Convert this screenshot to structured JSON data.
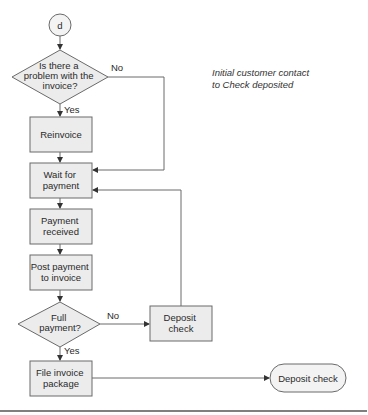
{
  "annotation": {
    "line1": "Initial customer contact",
    "line2": "to Check deposited"
  },
  "connector": {
    "label": "d"
  },
  "nodes": {
    "problem_decision": {
      "lines": [
        "Is there a",
        "problem with the",
        "invoice?"
      ],
      "yes": "Yes",
      "no": "No"
    },
    "reinvoice": {
      "lines": [
        "Reinvoice"
      ]
    },
    "wait_payment": {
      "lines": [
        "Wait for",
        "payment"
      ]
    },
    "payment_received": {
      "lines": [
        "Payment",
        "received"
      ]
    },
    "post_payment": {
      "lines": [
        "Post payment",
        "to invoice"
      ]
    },
    "full_payment_decision": {
      "lines": [
        "Full",
        "payment?"
      ],
      "yes": "Yes",
      "no": "No"
    },
    "deposit_check_box": {
      "lines": [
        "Deposit",
        "check"
      ]
    },
    "file_invoice": {
      "lines": [
        "File invoice",
        "package"
      ]
    },
    "deposit_check_terminal": {
      "lines": [
        "Deposit check"
      ]
    }
  },
  "colors": {
    "shape_fill": "#ececec",
    "stroke": "#6a6a6a",
    "text": "#2a2a2a"
  }
}
